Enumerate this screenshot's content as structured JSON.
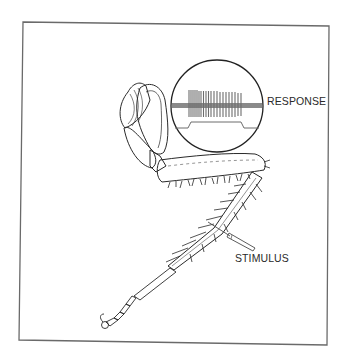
{
  "figure": {
    "labels": {
      "response": "RESPONSE",
      "stimulus": "STIMULUS"
    },
    "colors": {
      "ink": "#2a2a2a",
      "frame": "#6a6a6a",
      "trace": "#7a7a7a",
      "background": "#ffffff"
    },
    "inset": {
      "shape": "circle",
      "center": [
        217,
        106
      ],
      "radius": 46,
      "content": "nerve spike train above stimulus step trace"
    }
  }
}
